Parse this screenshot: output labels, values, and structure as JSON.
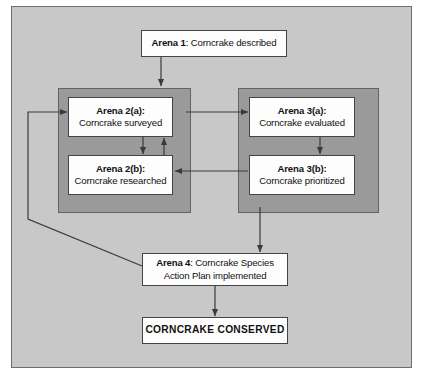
{
  "diagram": {
    "colors": {
      "panel_background": "#c8c8c8",
      "group_background": "#9a9a9a",
      "node_background": "#fdfdfd",
      "node_border": "#444444",
      "panel_border": "#6e6e6e",
      "connector": "#3a3a3a",
      "text": "#111111"
    },
    "nodes": [
      {
        "id": "arena1",
        "name": "arena-1-node",
        "label_bold": "Arena 1",
        "label_rest": ": Corncrake described",
        "lines": [
          "Arena 1: Corncrake described"
        ]
      },
      {
        "id": "arena2a",
        "name": "arena-2a-node",
        "line1_bold": "Arena 2(a):",
        "line2": "Corncrake surveyed"
      },
      {
        "id": "arena2b",
        "name": "arena-2b-node",
        "line1_bold": "Arena 2(b):",
        "line2": "Corncrake researched"
      },
      {
        "id": "arena3a",
        "name": "arena-3a-node",
        "line1_bold": "Arena 3(a):",
        "line2": "Corncrake evaluated"
      },
      {
        "id": "arena3b",
        "name": "arena-3b-node",
        "line1_bold": "Arena 3(b):",
        "line2": "Corncrake prioritized"
      },
      {
        "id": "arena4",
        "name": "arena-4-node",
        "line1_bold": "Arena 4",
        "line1_rest": ": Corncrake Species",
        "line2": "Action Plan implemented"
      },
      {
        "id": "conserved",
        "name": "corncrake-conserved-node",
        "label": "CORNCRAKE CONSERVED"
      }
    ],
    "groups": [
      {
        "id": "group2",
        "name": "arena-2-group"
      },
      {
        "id": "group3",
        "name": "arena-3-group"
      }
    ],
    "connectors": [
      {
        "id": "c1",
        "name": "connector-arena1-to-arena2a",
        "from": "arena1",
        "to": "arena2a",
        "style": "straight-down"
      },
      {
        "id": "c2",
        "name": "connector-arena2a-to-arena2b",
        "from": "arena2a",
        "to": "arena2b",
        "style": "straight-down"
      },
      {
        "id": "c3",
        "name": "connector-arena2b-to-arena2a",
        "from": "arena2b",
        "to": "arena2a",
        "style": "straight-up"
      },
      {
        "id": "c4",
        "name": "connector-arena2a-to-arena3a",
        "from": "arena2a",
        "to": "arena3a",
        "style": "straight-right"
      },
      {
        "id": "c5",
        "name": "connector-arena3a-to-arena3b",
        "from": "arena3a",
        "to": "arena3b",
        "style": "straight-down"
      },
      {
        "id": "c6",
        "name": "connector-arena3b-to-arena2b",
        "from": "arena3b",
        "to": "arena2b",
        "style": "straight-left"
      },
      {
        "id": "c7",
        "name": "connector-arena3-group-to-arena4",
        "from": "group3",
        "to": "arena4",
        "style": "straight-down"
      },
      {
        "id": "c8",
        "name": "connector-arena4-to-arena2a-feedback",
        "from": "arena4",
        "to": "arena2a",
        "style": "diagonal-loop-left"
      },
      {
        "id": "c9",
        "name": "connector-arena4-to-conserved",
        "from": "arena4",
        "to": "conserved",
        "style": "straight-down"
      }
    ]
  }
}
